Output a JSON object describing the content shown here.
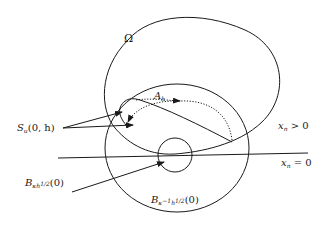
{
  "diagram": {
    "labels": {
      "omega": "Ω",
      "a_h": {
        "main": "A",
        "sub": "h"
      },
      "section": {
        "main": "S",
        "sub": "u",
        "args": "(0, h)"
      },
      "small_ball": {
        "main": "B",
        "sub": "κh",
        "sup": "1/2",
        "args": "(0)"
      },
      "large_ball": {
        "main": "B",
        "sub": "κ",
        "sub_sup": "−1",
        "sub2": "h",
        "sup": "1/2",
        "args": "(0)"
      },
      "upper_half": {
        "main": "x",
        "sub": "n",
        "rel": " > 0"
      },
      "boundary": {
        "main": "x",
        "sub": "n",
        "rel": " = 0"
      }
    },
    "colors": {
      "stroke": "#1a1a1a",
      "background": "#ffffff"
    }
  }
}
